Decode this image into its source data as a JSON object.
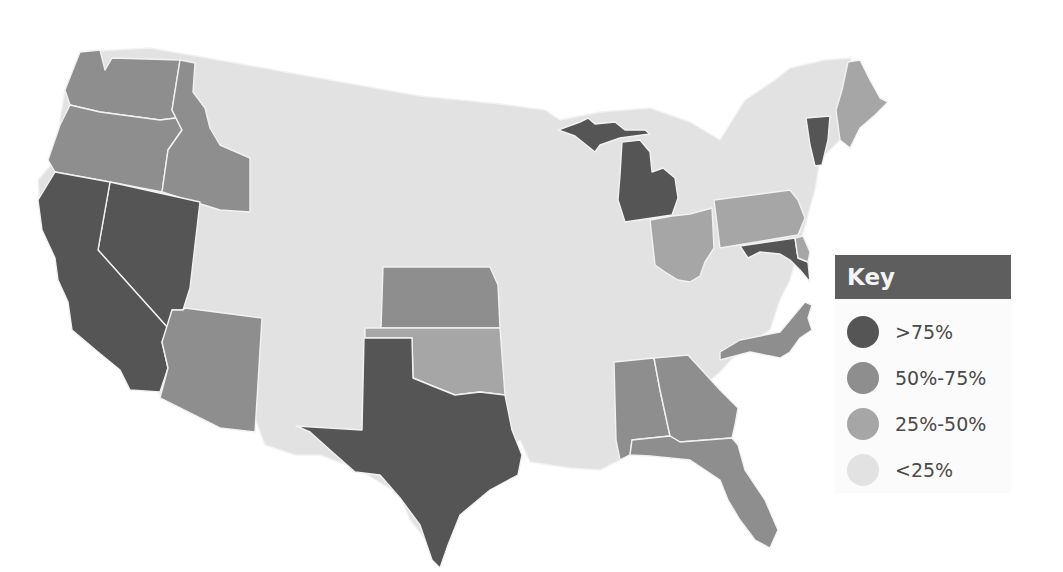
{
  "map": {
    "title": "",
    "background_fill": "#e2e2e2",
    "legend": {
      "title": "Key",
      "items": [
        {
          "label": ">75%",
          "color": "#555555",
          "category": "gt75"
        },
        {
          "label": "50%-75%",
          "color": "#8e8e8e",
          "category": "50to75"
        },
        {
          "label": "25%-50%",
          "color": "#a6a6a6",
          "category": "25to50"
        },
        {
          "label": "<25%",
          "color": "#e2e2e2",
          "category": "lt25"
        }
      ]
    },
    "states": [
      {
        "name": "California",
        "category": "gt75"
      },
      {
        "name": "Nevada",
        "category": "gt75"
      },
      {
        "name": "Texas",
        "category": "gt75"
      },
      {
        "name": "Michigan",
        "category": "gt75"
      },
      {
        "name": "Vermont",
        "category": "gt75"
      },
      {
        "name": "Maryland",
        "category": "gt75"
      },
      {
        "name": "Washington",
        "category": "50to75"
      },
      {
        "name": "Oregon",
        "category": "50to75"
      },
      {
        "name": "Idaho",
        "category": "50to75"
      },
      {
        "name": "Arizona",
        "category": "50to75"
      },
      {
        "name": "Kansas",
        "category": "50to75"
      },
      {
        "name": "Alabama",
        "category": "50to75"
      },
      {
        "name": "Georgia",
        "category": "50to75"
      },
      {
        "name": "Florida",
        "category": "50to75"
      },
      {
        "name": "North Carolina",
        "category": "50to75"
      },
      {
        "name": "Oklahoma",
        "category": "25to50"
      },
      {
        "name": "Ohio",
        "category": "25to50"
      },
      {
        "name": "Pennsylvania",
        "category": "25to50"
      },
      {
        "name": "Maine",
        "category": "25to50"
      },
      {
        "name": "Delaware",
        "category": "25to50"
      }
    ]
  }
}
